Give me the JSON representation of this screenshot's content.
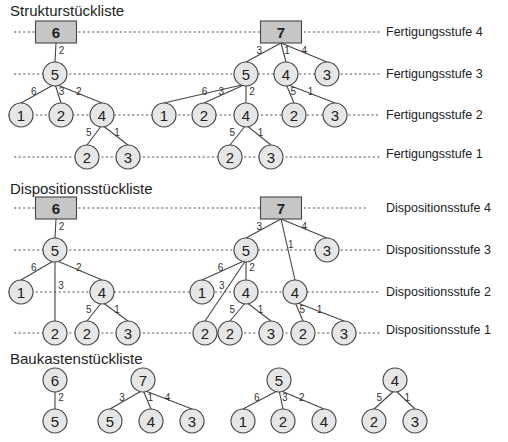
{
  "sections": {
    "struktur": {
      "title": "Strukturstückliste",
      "levels": [
        "Fertigungsstufe 4",
        "Fertigungsstufe 3",
        "Fertigungsstufe 2",
        "Fertigungsstufe 1"
      ]
    },
    "disposition": {
      "title": "Dispositionsstückliste",
      "levels": [
        "Dispositionsstufe 4",
        "Dispositionsstufe 3",
        "Dispositionsstufe 2",
        "Dispositionsstufe 1"
      ]
    },
    "baukasten": {
      "title": "Baukastenstückliste"
    }
  },
  "colors": {
    "product_box": "#c6c6c6",
    "node_fill": "#e6e6e6",
    "line": "#444444"
  },
  "struktur_nodes": [
    {
      "id": "s6",
      "label": "6",
      "x": 56,
      "y": 32,
      "type": "box"
    },
    {
      "id": "s7",
      "label": "7",
      "x": 281,
      "y": 32,
      "type": "box"
    },
    {
      "id": "s6_5",
      "label": "5",
      "x": 55,
      "y": 74
    },
    {
      "id": "s6_5_1",
      "label": "1",
      "x": 21,
      "y": 115
    },
    {
      "id": "s6_5_2",
      "label": "2",
      "x": 61,
      "y": 115
    },
    {
      "id": "s6_5_4",
      "label": "4",
      "x": 102,
      "y": 115
    },
    {
      "id": "s6_5_4_2",
      "label": "2",
      "x": 87,
      "y": 157
    },
    {
      "id": "s6_5_4_3",
      "label": "3",
      "x": 128,
      "y": 157
    },
    {
      "id": "s7_5",
      "label": "5",
      "x": 246,
      "y": 74
    },
    {
      "id": "s7_4",
      "label": "4",
      "x": 286,
      "y": 74
    },
    {
      "id": "s7_3",
      "label": "3",
      "x": 327,
      "y": 74
    },
    {
      "id": "s7_5_1",
      "label": "1",
      "x": 164,
      "y": 115
    },
    {
      "id": "s7_5_2",
      "label": "2",
      "x": 204,
      "y": 115
    },
    {
      "id": "s7_5_4",
      "label": "4",
      "x": 246,
      "y": 115
    },
    {
      "id": "s7_4_2",
      "label": "2",
      "x": 294,
      "y": 115
    },
    {
      "id": "s7_4_3",
      "label": "3",
      "x": 335,
      "y": 115
    },
    {
      "id": "s7_5_4_2",
      "label": "2",
      "x": 230,
      "y": 157
    },
    {
      "id": "s7_5_4_3",
      "label": "3",
      "x": 271,
      "y": 157
    }
  ],
  "struktur_edges": [
    {
      "from": "s6",
      "to": "s6_5",
      "qty": "2"
    },
    {
      "from": "s6_5",
      "to": "s6_5_1",
      "qty": "6"
    },
    {
      "from": "s6_5",
      "to": "s6_5_2",
      "qty": "3"
    },
    {
      "from": "s6_5",
      "to": "s6_5_4",
      "qty": "2"
    },
    {
      "from": "s6_5_4",
      "to": "s6_5_4_2",
      "qty": "5"
    },
    {
      "from": "s6_5_4",
      "to": "s6_5_4_3",
      "qty": "1"
    },
    {
      "from": "s7",
      "to": "s7_5",
      "qty": "3"
    },
    {
      "from": "s7",
      "to": "s7_4",
      "qty": "1"
    },
    {
      "from": "s7",
      "to": "s7_3",
      "qty": "4"
    },
    {
      "from": "s7_5",
      "to": "s7_5_1",
      "qty": "6"
    },
    {
      "from": "s7_5",
      "to": "s7_5_2",
      "qty": "3"
    },
    {
      "from": "s7_5",
      "to": "s7_5_4",
      "qty": "2"
    },
    {
      "from": "s7_4",
      "to": "s7_4_2",
      "qty": "5"
    },
    {
      "from": "s7_4",
      "to": "s7_4_3",
      "qty": "1"
    },
    {
      "from": "s7_5_4",
      "to": "s7_5_4_2",
      "qty": "5"
    },
    {
      "from": "s7_5_4",
      "to": "s7_5_4_3",
      "qty": "1"
    }
  ],
  "dispo_nodes": [
    {
      "id": "d6",
      "label": "6",
      "x": 56,
      "y": 208,
      "type": "box"
    },
    {
      "id": "d7",
      "label": "7",
      "x": 281,
      "y": 208,
      "type": "box"
    },
    {
      "id": "d6_5",
      "label": "5",
      "x": 55,
      "y": 250
    },
    {
      "id": "d6_5_1",
      "label": "1",
      "x": 21,
      "y": 292
    },
    {
      "id": "d6_5_4",
      "label": "4",
      "x": 102,
      "y": 292
    },
    {
      "id": "d6_5_2",
      "label": "2",
      "x": 55,
      "y": 333
    },
    {
      "id": "d6_5_4_2",
      "label": "2",
      "x": 87,
      "y": 333
    },
    {
      "id": "d6_5_4_3",
      "label": "3",
      "x": 128,
      "y": 333
    },
    {
      "id": "d7_5",
      "label": "5",
      "x": 246,
      "y": 250
    },
    {
      "id": "d7_3",
      "label": "3",
      "x": 327,
      "y": 250
    },
    {
      "id": "d7_5_1",
      "label": "1",
      "x": 202,
      "y": 292
    },
    {
      "id": "d7_5_4",
      "label": "4",
      "x": 246,
      "y": 292
    },
    {
      "id": "d7_4",
      "label": "4",
      "x": 295,
      "y": 292
    },
    {
      "id": "d7_5_2",
      "label": "2",
      "x": 205,
      "y": 333
    },
    {
      "id": "d7_5_4_2",
      "label": "2",
      "x": 230,
      "y": 333
    },
    {
      "id": "d7_5_4_3",
      "label": "3",
      "x": 271,
      "y": 333
    },
    {
      "id": "d7_4_2",
      "label": "2",
      "x": 303,
      "y": 333
    },
    {
      "id": "d7_4_3",
      "label": "3",
      "x": 344,
      "y": 333
    }
  ],
  "dispo_edges": [
    {
      "from": "d6",
      "to": "d6_5",
      "qty": "2"
    },
    {
      "from": "d6_5",
      "to": "d6_5_1",
      "qty": "6"
    },
    {
      "from": "d6_5",
      "to": "d6_5_2",
      "qty": "3"
    },
    {
      "from": "d6_5",
      "to": "d6_5_4",
      "qty": "2"
    },
    {
      "from": "d6_5_4",
      "to": "d6_5_4_2",
      "qty": "5"
    },
    {
      "from": "d6_5_4",
      "to": "d6_5_4_3",
      "qty": "1"
    },
    {
      "from": "d7",
      "to": "d7_5",
      "qty": "3"
    },
    {
      "from": "d7",
      "to": "d7_4",
      "qty": "1"
    },
    {
      "from": "d7",
      "to": "d7_3",
      "qty": "4"
    },
    {
      "from": "d7_5",
      "to": "d7_5_1",
      "qty": "6"
    },
    {
      "from": "d7_5",
      "to": "d7_5_2",
      "qty": "3"
    },
    {
      "from": "d7_5",
      "to": "d7_5_4",
      "qty": "2"
    },
    {
      "from": "d7_5_4",
      "to": "d7_5_4_2",
      "qty": "5"
    },
    {
      "from": "d7_5_4",
      "to": "d7_5_4_3",
      "qty": "1"
    },
    {
      "from": "d7_4",
      "to": "d7_4_2",
      "qty": "5"
    },
    {
      "from": "d7_4",
      "to": "d7_4_3",
      "qty": "1"
    }
  ],
  "bauk_nodes": [
    {
      "id": "b6",
      "label": "6",
      "x": 55,
      "y": 380
    },
    {
      "id": "b6_5",
      "label": "5",
      "x": 55,
      "y": 421
    },
    {
      "id": "b7",
      "label": "7",
      "x": 143,
      "y": 380
    },
    {
      "id": "b7_5",
      "label": "5",
      "x": 110,
      "y": 421
    },
    {
      "id": "b7_4",
      "label": "4",
      "x": 151,
      "y": 421
    },
    {
      "id": "b7_3",
      "label": "3",
      "x": 192,
      "y": 421
    },
    {
      "id": "b5",
      "label": "5",
      "x": 279,
      "y": 380
    },
    {
      "id": "b5_1",
      "label": "1",
      "x": 243,
      "y": 421
    },
    {
      "id": "b5_2",
      "label": "2",
      "x": 283,
      "y": 421
    },
    {
      "id": "b5_4",
      "label": "4",
      "x": 324,
      "y": 421
    },
    {
      "id": "b4",
      "label": "4",
      "x": 395,
      "y": 380
    },
    {
      "id": "b4_2",
      "label": "2",
      "x": 374,
      "y": 421
    },
    {
      "id": "b4_3",
      "label": "3",
      "x": 415,
      "y": 421
    }
  ],
  "bauk_edges": [
    {
      "from": "b6",
      "to": "b6_5",
      "qty": "2"
    },
    {
      "from": "b7",
      "to": "b7_5",
      "qty": "3"
    },
    {
      "from": "b7",
      "to": "b7_4",
      "qty": "1"
    },
    {
      "from": "b7",
      "to": "b7_3",
      "qty": "4"
    },
    {
      "from": "b5",
      "to": "b5_1",
      "qty": "6"
    },
    {
      "from": "b5",
      "to": "b5_2",
      "qty": "3"
    },
    {
      "from": "b5",
      "to": "b5_4",
      "qty": "2"
    },
    {
      "from": "b4",
      "to": "b4_2",
      "qty": "5"
    },
    {
      "from": "b4",
      "to": "b4_3",
      "qty": "1"
    }
  ]
}
